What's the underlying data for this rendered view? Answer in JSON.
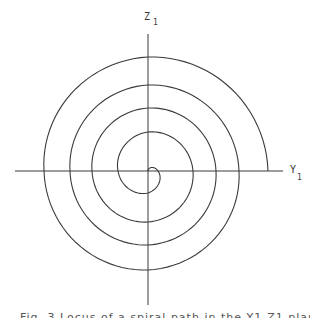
{
  "figure": {
    "type": "spiral-diagram",
    "stroke_color": "#3a3a3a",
    "center": {
      "x": 148,
      "y": 171
    },
    "axes": {
      "vertical": {
        "label": "Z",
        "subscript": "1",
        "x": 148,
        "y_start": 34,
        "y_end": 305
      },
      "horizontal": {
        "label": "Y",
        "subscript": "1",
        "y": 171,
        "x_start": 15,
        "x_end": 283
      }
    },
    "spiral": {
      "turns": 4,
      "direction": "clockwise-on-screen",
      "quarter_radii": [
        10,
        22,
        30,
        39,
        45,
        51,
        56,
        63,
        68,
        74,
        78,
        86,
        91,
        99,
        104,
        114,
        120
      ],
      "end_point": {
        "x": 268,
        "y": 171
      }
    }
  },
  "caption": {
    "text": "Fig. 3  Locus of a spiral path in the Y1-Z1 plane"
  }
}
